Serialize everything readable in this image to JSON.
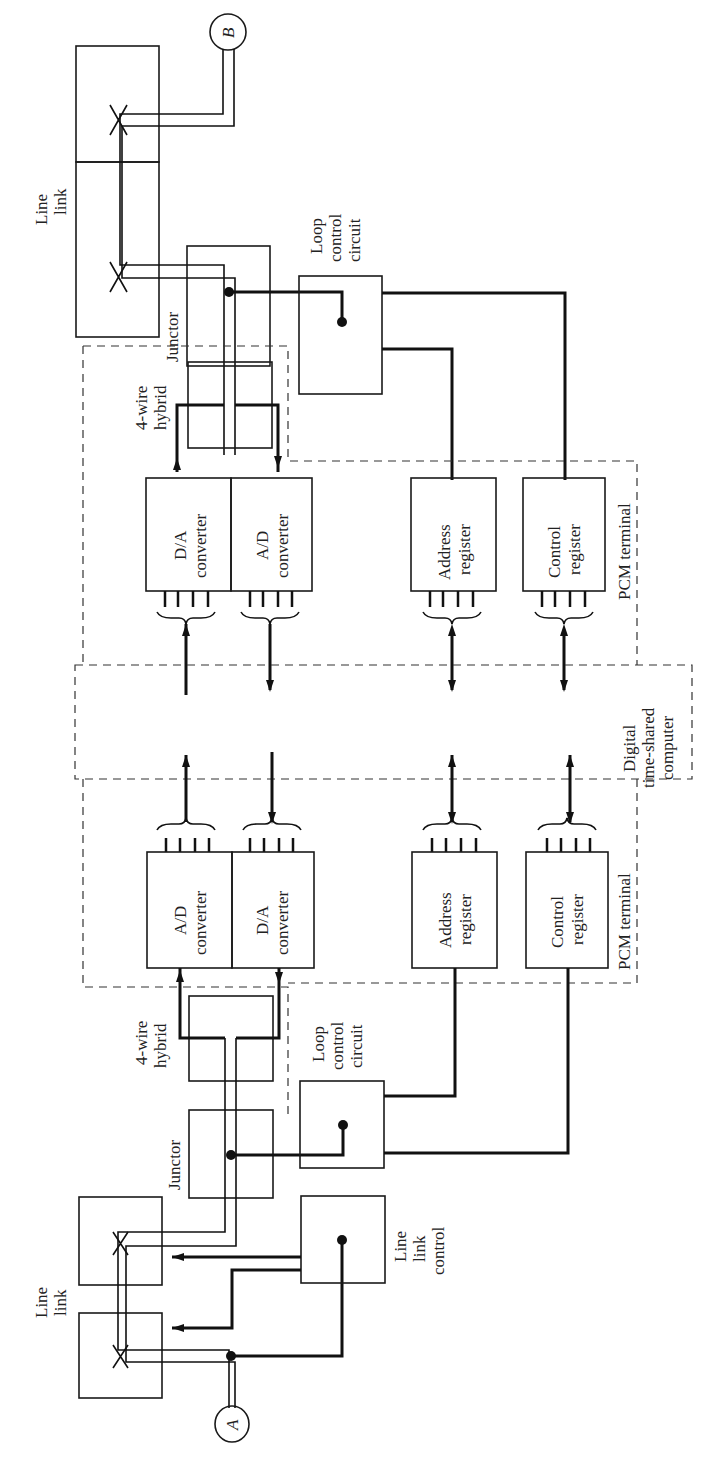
{
  "diagram": {
    "orientation": "rotated-90-ccw",
    "nodes": {
      "terminal_a": "A",
      "terminal_b": "B",
      "line_link_top_label_1": "Line",
      "line_link_top_label_2": "link",
      "line_link_bottom_label_1": "Line",
      "line_link_bottom_label_2": "link",
      "line_link_control_1": "Line",
      "line_link_control_2": "link",
      "line_link_control_3": "control",
      "junctor_top": "Junctor",
      "junctor_bottom": "Junctor",
      "loop_top_1": "Loop",
      "loop_top_2": "control",
      "loop_top_3": "circuit",
      "loop_bottom_1": "Loop",
      "loop_bottom_2": "control",
      "loop_bottom_3": "circuit",
      "hybrid_top_1": "4-wire",
      "hybrid_top_2": "hybrid",
      "hybrid_bottom_1": "4-wire",
      "hybrid_bottom_2": "hybrid",
      "da_top_1": "D/A",
      "da_top_2": "converter",
      "ad_top_1": "A/D",
      "ad_top_2": "converter",
      "ad_bottom_1": "A/D",
      "ad_bottom_2": "converter",
      "da_bottom_1": "D/A",
      "da_bottom_2": "converter",
      "addr_top_1": "Address",
      "addr_top_2": "register",
      "ctrl_top_1": "Control",
      "ctrl_top_2": "register",
      "addr_bottom_1": "Address",
      "addr_bottom_2": "register",
      "ctrl_bottom_1": "Control",
      "ctrl_bottom_2": "register",
      "pcm_top": "PCM terminal",
      "pcm_bottom": "PCM terminal",
      "computer_1": "Digital",
      "computer_2": "time-shared",
      "computer_3": "computer"
    }
  }
}
